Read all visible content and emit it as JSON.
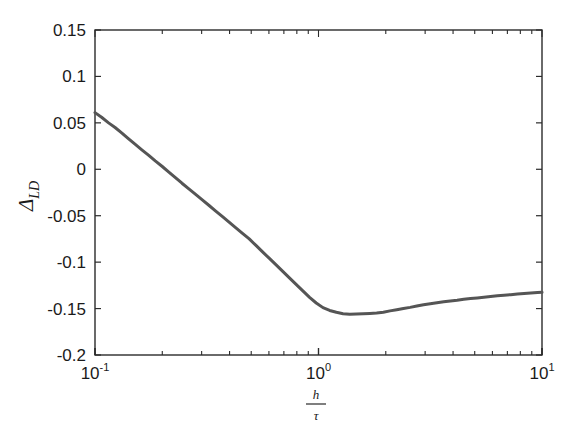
{
  "figure": {
    "background_color": "#ffffff",
    "axis_color": "#2b2b2b",
    "line_color": "#555555"
  },
  "axes": {
    "y_ticks": [
      "0.15",
      "0.1",
      "0.05",
      "0",
      "-0.05",
      "-0.1",
      "-0.15",
      "-0.2"
    ],
    "x_tick_mantissas": [
      "10",
      "10",
      "10"
    ],
    "x_tick_exponents": [
      "-1",
      "0",
      "1"
    ],
    "y_label_base": "Δ",
    "y_label_sub": "LD",
    "x_label_numerator": "h",
    "x_label_denominator": "τ"
  },
  "chart_data": {
    "type": "line",
    "title": "",
    "xlabel": "h/τ",
    "ylabel": "Δ_LD",
    "xscale": "log",
    "yscale": "linear",
    "xlim": [
      0.1,
      10
    ],
    "ylim": [
      -0.2,
      0.15
    ],
    "ytick_values": [
      0.15,
      0.1,
      0.05,
      0,
      -0.05,
      -0.1,
      -0.15,
      -0.2
    ],
    "xtick_values": [
      0.1,
      1,
      10
    ],
    "grid": false,
    "legend": null,
    "series": [
      {
        "name": "Delta_LD",
        "color": "#555555",
        "linewidth": 3,
        "x": [
          0.1,
          0.107,
          0.115,
          0.123,
          0.132,
          0.141,
          0.151,
          0.162,
          0.174,
          0.186,
          0.2,
          0.214,
          0.229,
          0.245,
          0.263,
          0.282,
          0.302,
          0.324,
          0.347,
          0.372,
          0.398,
          0.427,
          0.457,
          0.49,
          0.525,
          0.562,
          0.603,
          0.646,
          0.692,
          0.741,
          0.794,
          0.851,
          0.912,
          0.977,
          1.047,
          1.122,
          1.202,
          1.288,
          1.38,
          1.479,
          1.585,
          1.698,
          1.82,
          1.95,
          2.089,
          2.239,
          2.399,
          2.57,
          2.754,
          2.951,
          3.162,
          3.388,
          3.631,
          3.89,
          4.169,
          4.467,
          4.786,
          5.129,
          5.495,
          5.888,
          6.31,
          6.761,
          7.244,
          7.762,
          8.318,
          8.913,
          9.55,
          10.0
        ],
        "y": [
          0.061,
          0.056,
          0.05,
          0.045,
          0.039,
          0.033,
          0.027,
          0.021,
          0.015,
          0.009,
          0.003,
          -0.003,
          -0.009,
          -0.015,
          -0.021,
          -0.027,
          -0.033,
          -0.039,
          -0.045,
          -0.051,
          -0.057,
          -0.063,
          -0.069,
          -0.075,
          -0.082,
          -0.089,
          -0.096,
          -0.103,
          -0.11,
          -0.117,
          -0.124,
          -0.131,
          -0.138,
          -0.144,
          -0.149,
          -0.152,
          -0.154,
          -0.1555,
          -0.156,
          -0.1558,
          -0.1555,
          -0.1552,
          -0.1548,
          -0.154,
          -0.1525,
          -0.1512,
          -0.15,
          -0.1487,
          -0.1472,
          -0.1458,
          -0.1447,
          -0.1437,
          -0.1427,
          -0.1418,
          -0.141,
          -0.14,
          -0.1392,
          -0.1385,
          -0.1378,
          -0.137,
          -0.1362,
          -0.1356,
          -0.135,
          -0.1344,
          -0.1338,
          -0.1333,
          -0.1328,
          -0.1325
        ],
        "min_value": -0.156,
        "min_at_x": 1.38,
        "start_value": 0.061,
        "end_value": -0.1325
      }
    ]
  }
}
